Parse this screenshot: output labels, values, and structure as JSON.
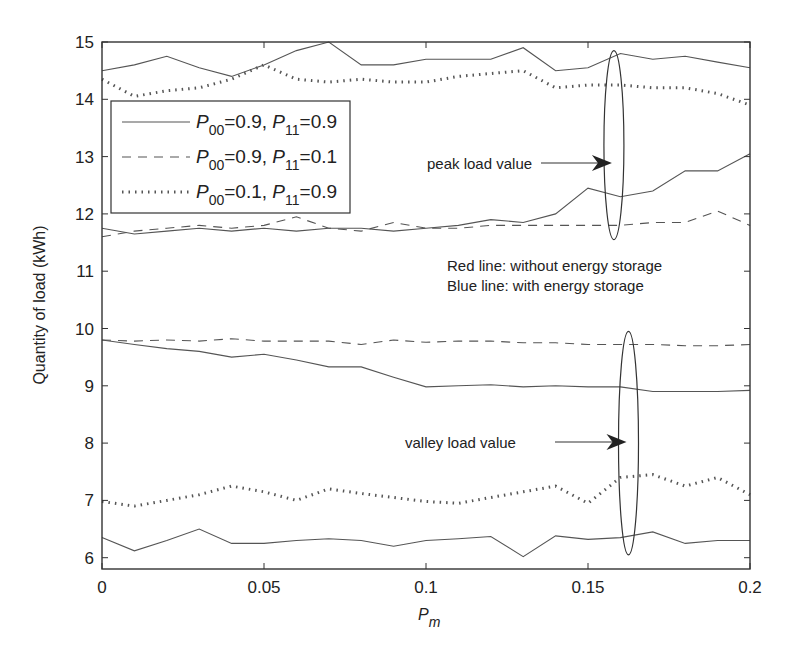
{
  "chart_data": {
    "type": "line",
    "title": "",
    "xlabel": "P_m",
    "ylabel": "Quantity of load (kWh)",
    "xlim": [
      0,
      0.2
    ],
    "ylim": [
      5.8,
      15
    ],
    "grid": false,
    "legend_position": "upper-left",
    "xticks": [
      0,
      0.05,
      0.1,
      0.15,
      0.2
    ],
    "xtick_labels": [
      "0",
      "0.05",
      "0.1",
      "0.15",
      "0.2"
    ],
    "yticks": [
      6,
      7,
      8,
      9,
      10,
      11,
      12,
      13,
      14,
      15
    ],
    "ytick_labels": [
      "6",
      "7",
      "8",
      "9",
      "10",
      "11",
      "12",
      "13",
      "14",
      "15"
    ],
    "x": [
      0,
      0.01,
      0.02,
      0.03,
      0.04,
      0.05,
      0.06,
      0.07,
      0.08,
      0.09,
      0.1,
      0.11,
      0.12,
      0.13,
      0.14,
      0.15,
      0.16,
      0.17,
      0.18,
      0.19,
      0.2
    ],
    "series": [
      {
        "name": "P00=0.9, P11=0.9 (peak, without storage)",
        "style": "solid",
        "values": [
          14.5,
          14.6,
          14.75,
          14.55,
          14.4,
          14.6,
          14.85,
          15.0,
          14.6,
          14.6,
          14.7,
          14.7,
          14.7,
          14.9,
          14.5,
          14.55,
          14.8,
          14.7,
          14.75,
          14.65,
          14.55
        ]
      },
      {
        "name": "P00=0.1, P11=0.9 (peak, without storage)",
        "style": "dotted",
        "values": [
          14.35,
          14.05,
          14.15,
          14.2,
          14.35,
          14.6,
          14.35,
          14.3,
          14.35,
          14.3,
          14.3,
          14.4,
          14.45,
          14.5,
          14.2,
          14.25,
          14.25,
          14.2,
          14.2,
          14.1,
          13.9
        ]
      },
      {
        "name": "P00=0.9, P11=0.9 (peak, with storage)",
        "style": "solid",
        "values": [
          11.75,
          11.65,
          11.7,
          11.75,
          11.7,
          11.75,
          11.7,
          11.75,
          11.75,
          11.7,
          11.75,
          11.8,
          11.9,
          11.85,
          12.0,
          12.45,
          12.3,
          12.4,
          12.75,
          12.75,
          13.05
        ]
      },
      {
        "name": "P00=0.9, P11=0.1 (peak)",
        "style": "dashed",
        "values": [
          11.6,
          11.7,
          11.75,
          11.8,
          11.75,
          11.8,
          11.95,
          11.75,
          11.7,
          11.85,
          11.75,
          11.75,
          11.8,
          11.8,
          11.8,
          11.8,
          11.8,
          11.85,
          11.85,
          12.05,
          11.8
        ]
      },
      {
        "name": "P00=0.9, P11=0.1 (valley)",
        "style": "dashed",
        "values": [
          9.8,
          9.78,
          9.8,
          9.78,
          9.82,
          9.78,
          9.78,
          9.78,
          9.72,
          9.8,
          9.76,
          9.78,
          9.78,
          9.75,
          9.75,
          9.72,
          9.72,
          9.72,
          9.7,
          9.7,
          9.72
        ]
      },
      {
        "name": "P00=0.9, P11=0.9 (valley, with storage)",
        "style": "solid",
        "values": [
          9.8,
          9.72,
          9.65,
          9.6,
          9.5,
          9.55,
          9.45,
          9.33,
          9.33,
          9.15,
          8.98,
          9.0,
          9.02,
          8.98,
          9.0,
          8.98,
          8.98,
          8.9,
          8.9,
          8.9,
          8.92
        ]
      },
      {
        "name": "P00=0.1, P11=0.9 (valley)",
        "style": "dotted",
        "values": [
          6.98,
          6.9,
          7.0,
          7.1,
          7.25,
          7.15,
          7.0,
          7.2,
          7.12,
          7.05,
          6.98,
          6.95,
          7.05,
          7.15,
          7.25,
          6.95,
          7.4,
          7.45,
          7.25,
          7.4,
          7.1
        ]
      },
      {
        "name": "P00=0.9, P11=0.9 (valley, without storage)",
        "style": "solid",
        "values": [
          6.35,
          6.12,
          6.3,
          6.5,
          6.25,
          6.25,
          6.3,
          6.33,
          6.3,
          6.2,
          6.3,
          6.33,
          6.37,
          6.02,
          6.38,
          6.32,
          6.35,
          6.45,
          6.25,
          6.3,
          6.3
        ]
      }
    ],
    "legend": [
      {
        "style": "solid",
        "p00": "0.9",
        "p11": "0.9"
      },
      {
        "style": "dashed",
        "p00": "0.9",
        "p11": "0.1"
      },
      {
        "style": "dotted",
        "p00": "0.1",
        "p11": "0.9"
      }
    ],
    "annotations": [
      {
        "text": "peak load value",
        "x": 0.158,
        "y": 12.9
      },
      {
        "text": "valley load value",
        "x": 0.162,
        "y": 8.0
      },
      {
        "text": "Red line: without energy storage",
        "x": 0.128,
        "y": 11.25
      },
      {
        "text": "Blue line: with energy storage",
        "x": 0.128,
        "y": 10.9
      }
    ],
    "ellipses": [
      {
        "label": "peak-ellipse",
        "cx": 0.158,
        "cy": 13.2,
        "ry_units": 1.65
      },
      {
        "label": "valley-ellipse",
        "cx": 0.1625,
        "cy": 8.0,
        "ry_units": 1.95
      }
    ]
  },
  "labels": {
    "ylabel": "Quantity of load (kWh)",
    "xlabel_main": "P",
    "xlabel_sub": "m",
    "peak": "peak load value",
    "valley": "valley load value",
    "red_line": "Red line: without energy storage",
    "blue_line": "Blue line: with energy storage",
    "legend_P": "P",
    "legend_00": "00",
    "legend_11": "11"
  }
}
